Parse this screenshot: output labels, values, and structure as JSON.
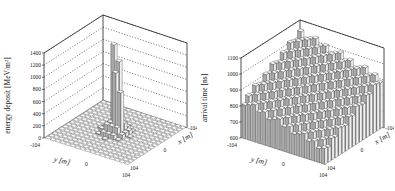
{
  "chart_data": [
    {
      "type": "bar3d",
      "title": "",
      "zlabel": "energy deposit",
      "zunit": "[MeV/m²]",
      "zticks": [
        0,
        200,
        400,
        600,
        800,
        1000,
        1200,
        1400
      ],
      "zlim": [
        0,
        1400
      ],
      "ylabel": "y [m]",
      "xlabel": "x [m]",
      "yticks": [
        "-104",
        "0",
        "104"
      ],
      "xticks": [
        "-104",
        "0",
        "104"
      ],
      "grid": true,
      "grid_n": 17,
      "peak": {
        "description": "sharp core near center",
        "values": [
          1400,
          1150,
          1000,
          700
        ]
      },
      "baseline": 0
    },
    {
      "type": "bar3d",
      "title": "",
      "zlabel": "arrival time",
      "zunit": "[ns]",
      "zticks": [
        600,
        700,
        800,
        900,
        1000,
        1100
      ],
      "zlim": [
        600,
        1100
      ],
      "ylabel": "y [m]",
      "xlabel": "x [m]",
      "yticks": [
        "-104",
        "0",
        "104"
      ],
      "xticks": [
        "-104",
        "0",
        "104"
      ],
      "grid": true,
      "grid_n": 17,
      "description": "arrival time increases from ~700 ns at front (y=-104) to ~1100 ns at back corner"
    }
  ],
  "labels": {
    "left": {
      "zlabel": "energy deposit",
      "zunit": "[MeV/m²]",
      "ticks": [
        "0",
        "200",
        "400",
        "600",
        "800",
        "1000",
        "1200",
        "1400"
      ],
      "y_axis": "y [m]",
      "x_axis": "x [m]",
      "y_minus": "-104",
      "y_zero": "0",
      "y_plus": "104",
      "x_minus": "-104",
      "x_zero": "0",
      "x_plus": "104"
    },
    "right": {
      "zlabel": "arrival time",
      "zunit": "[ns]",
      "ticks": [
        "600",
        "700",
        "800",
        "900",
        "1000",
        "1100"
      ],
      "y_axis": "y [m]",
      "x_axis": "x [m]",
      "y_minus": "-104",
      "y_zero": "0",
      "y_plus": "104",
      "x_minus": "-104",
      "x_zero": "0",
      "x_plus": "104"
    }
  }
}
